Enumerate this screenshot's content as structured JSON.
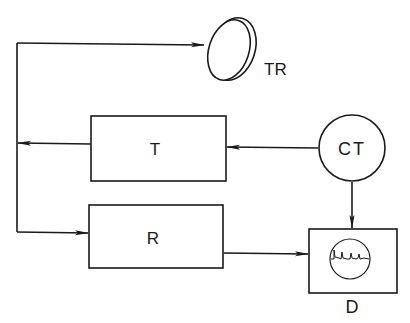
{
  "diagram": {
    "type": "block-diagram",
    "nodes": {
      "transducer": {
        "label": "TR",
        "shape": "disc"
      },
      "transmitter": {
        "label": "T",
        "shape": "rectangle"
      },
      "clock_timer": {
        "label": "CT",
        "shape": "circle"
      },
      "receiver": {
        "label": "R",
        "shape": "rectangle"
      },
      "display": {
        "label": "D",
        "shape": "rectangle-with-scope"
      }
    },
    "edges": [
      {
        "from": "CT",
        "to": "T"
      },
      {
        "from": "T",
        "to": "TR"
      },
      {
        "from": "TR",
        "to": "R"
      },
      {
        "from": "CT",
        "to": "D"
      },
      {
        "from": "R",
        "to": "D"
      }
    ],
    "colors": {
      "stroke": "#1a1a1a",
      "background": "#ffffff"
    }
  }
}
